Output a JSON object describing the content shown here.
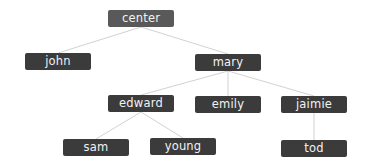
{
  "tree": {
    "root": "center",
    "colors": {
      "root_fill": "#595959",
      "node_fill": "#3b3b3b",
      "text": "#f2f2f2",
      "edge": "#d2d2d2",
      "background": "#ffffff"
    },
    "nodes": [
      {
        "id": "center",
        "label": "center",
        "parent": null,
        "level": 0
      },
      {
        "id": "john",
        "label": "john",
        "parent": "center",
        "level": 1
      },
      {
        "id": "mary",
        "label": "mary",
        "parent": "center",
        "level": 1
      },
      {
        "id": "edward",
        "label": "edward",
        "parent": "mary",
        "level": 2
      },
      {
        "id": "emily",
        "label": "emily",
        "parent": "mary",
        "level": 2
      },
      {
        "id": "jaimie",
        "label": "jaimie",
        "parent": "mary",
        "level": 2
      },
      {
        "id": "sam",
        "label": "sam",
        "parent": "edward",
        "level": 3
      },
      {
        "id": "young",
        "label": "young",
        "parent": "edward",
        "level": 3
      },
      {
        "id": "tod",
        "label": "tod",
        "parent": "jaimie",
        "level": 3
      }
    ]
  }
}
